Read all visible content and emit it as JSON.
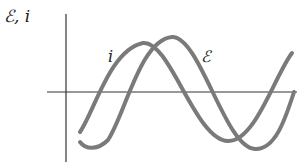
{
  "figure": {
    "y_axis_label": "ℰ, i",
    "curve_labels": {
      "current": "i",
      "emf": "ℰ"
    },
    "colors": {
      "axes": "#333333",
      "curves": "#7a7a7a"
    }
  },
  "diagram_data": {
    "type": "phasor-waveforms",
    "description": "Sinusoidal emf ℰ and current i versus time; current leads emf",
    "curves": [
      {
        "name": "i",
        "label": "i",
        "peak": [
          143,
          43
        ],
        "trough": [
          228,
          141
        ]
      },
      {
        "name": "emf",
        "label": "ℰ",
        "peak": [
          172,
          37
        ],
        "trough": [
          255,
          149
        ]
      }
    ],
    "axes": {
      "origin": [
        66,
        92
      ]
    }
  }
}
